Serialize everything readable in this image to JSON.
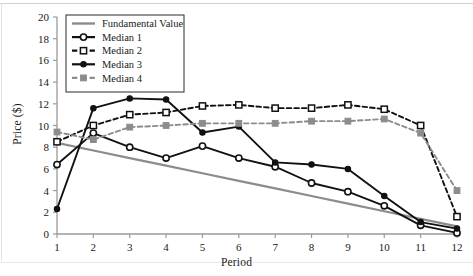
{
  "chart_data": {
    "type": "line",
    "title": "",
    "xlabel": "Period",
    "ylabel": "Price ($)",
    "x": [
      1,
      2,
      3,
      4,
      5,
      6,
      7,
      8,
      9,
      10,
      11,
      12
    ],
    "xticklabels": [
      "1",
      "2",
      "3",
      "4",
      "5",
      "6",
      "7",
      "8",
      "9",
      "10",
      "11",
      "12"
    ],
    "yticklabels": [
      "0",
      "2",
      "4",
      "6",
      "8",
      "10",
      "12",
      "14",
      "16",
      "18",
      "20"
    ],
    "yticks": [
      0,
      2,
      4,
      6,
      8,
      10,
      12,
      14,
      16,
      18,
      20
    ],
    "xlim": [
      1,
      12
    ],
    "ylim": [
      0,
      20
    ],
    "grid": false,
    "legend_position": "upper-left",
    "series": [
      {
        "name": "Fundamental Value",
        "color": "#8c8c8c",
        "linestyle": "solid",
        "marker": "none",
        "values": [
          8.4,
          7.7,
          7.0,
          6.3,
          5.6,
          4.9,
          4.2,
          3.5,
          2.8,
          2.1,
          1.4,
          0.7
        ]
      },
      {
        "name": "Median 1",
        "color": "#111111",
        "linestyle": "solid",
        "marker": "open-circle",
        "values": [
          6.4,
          9.3,
          8.0,
          7.0,
          8.1,
          7.0,
          6.2,
          4.7,
          3.9,
          2.6,
          0.8,
          0.1
        ]
      },
      {
        "name": "Median 2",
        "color": "#111111",
        "linestyle": "dashed",
        "marker": "open-square",
        "values": [
          8.5,
          10.0,
          11.0,
          11.2,
          11.8,
          11.9,
          11.6,
          11.6,
          11.9,
          11.5,
          10.0,
          1.6
        ]
      },
      {
        "name": "Median 3",
        "color": "#111111",
        "linestyle": "solid",
        "marker": "filled-circle",
        "values": [
          2.3,
          11.6,
          12.5,
          12.4,
          9.35,
          9.9,
          6.6,
          6.4,
          6.0,
          3.5,
          1.1,
          0.5
        ]
      },
      {
        "name": "Median 4",
        "color": "#8c8c8c",
        "linestyle": "dashed",
        "marker": "filled-square",
        "values": [
          9.4,
          8.7,
          9.85,
          10.0,
          10.2,
          10.2,
          10.2,
          10.4,
          10.4,
          10.6,
          9.3,
          4.0
        ]
      }
    ]
  },
  "legend": {
    "items": [
      {
        "label": "Fundamental Value"
      },
      {
        "label": "Median 1"
      },
      {
        "label": "Median 2"
      },
      {
        "label": "Median 3"
      },
      {
        "label": "Median 4"
      }
    ]
  },
  "axes": {
    "y_title": "Price ($)",
    "x_title": "Period"
  }
}
